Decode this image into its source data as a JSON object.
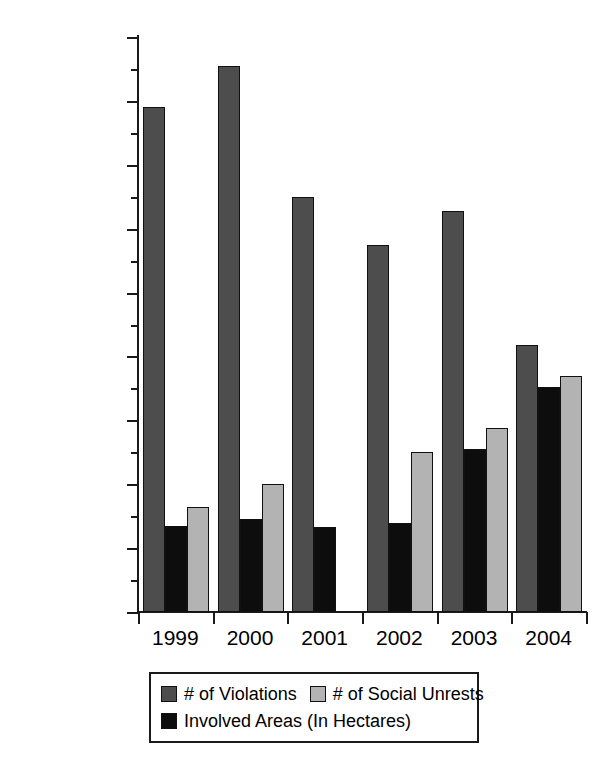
{
  "chart_data": {
    "type": "bar",
    "title": "",
    "xlabel": "",
    "ylabel": "",
    "categories": [
      "1999",
      "2000",
      "2001",
      "2002",
      "2003",
      "2004"
    ],
    "series": [
      {
        "name": "# of Violations",
        "color": "#4d4d4d",
        "values": [
          158000,
          171000,
          130000,
          115000,
          125500,
          83500
        ]
      },
      {
        "name": "Involved Areas (In Hectares)",
        "color": "#0d0d0d",
        "values": [
          27000,
          29000,
          26500,
          28000,
          51000,
          70500
        ]
      },
      {
        "name": "# of Social Unrests",
        "color": "#b3b3b3",
        "values": [
          33000,
          40000,
          0,
          50000,
          57500,
          74000
        ]
      }
    ],
    "series_order_in_plot": [
      "# of Violations",
      "Involved Areas (In Hectares)",
      "# of Social Unrests"
    ],
    "ylim": [
      0,
      180000
    ],
    "ytick_values": [
      0,
      20000,
      40000,
      60000,
      80000,
      100000,
      120000,
      140000,
      160000,
      180000
    ],
    "ytick_labels": [
      "0",
      "20,000",
      "40,000",
      "60,000",
      "80,000",
      "100,000",
      "120,000",
      "140,000",
      "160,000",
      "180,000"
    ],
    "yminor_tick_values": [
      10000,
      30000,
      50000,
      70000,
      90000,
      110000,
      130000,
      150000,
      170000
    ],
    "grid": false,
    "legend_position": "bottom",
    "legend_entries": [
      {
        "label": "# of Violations",
        "color": "#4d4d4d"
      },
      {
        "label": "# of Social Unrests",
        "color": "#b3b3b3"
      },
      {
        "label": "Involved Areas (In Hectares)",
        "color": "#0d0d0d"
      }
    ]
  }
}
